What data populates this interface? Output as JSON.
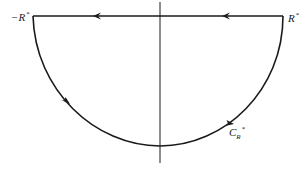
{
  "diagram": {
    "type": "contour",
    "colors": {
      "stroke": "#1a1a1a",
      "background": "#ffffff"
    },
    "labels": {
      "left_endpoint": "−R",
      "left_endpoint_sup": "*",
      "right_endpoint": "R",
      "right_endpoint_sup": "*",
      "arc": "C",
      "arc_sub": "R",
      "arc_sup": "*"
    },
    "arrows": [
      {
        "on": "real-axis-segment",
        "direction": "left",
        "count": 2
      },
      {
        "on": "arc",
        "direction": "counter-clockwise (left side going down)"
      },
      {
        "on": "arc",
        "direction": "counter-clockwise (right side going up)"
      }
    ]
  }
}
